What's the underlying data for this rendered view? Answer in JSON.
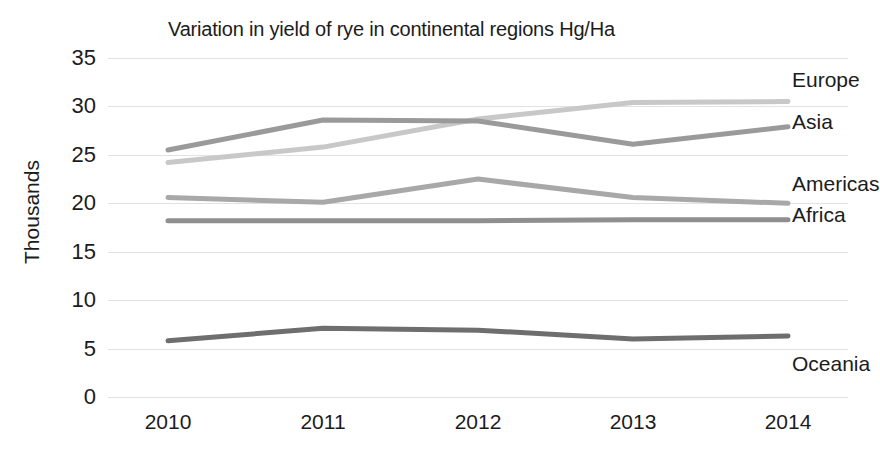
{
  "chart_data": {
    "type": "line",
    "title": "Variation in yield of rye in continental regions Hg/Ha",
    "xlabel": "",
    "ylabel": "Thousands",
    "categories": [
      "2010",
      "2011",
      "2012",
      "2013",
      "2014"
    ],
    "ylim": [
      0,
      35
    ],
    "yticks": [
      "0",
      "5",
      "10",
      "15",
      "20",
      "25",
      "30",
      "35"
    ],
    "grid": true,
    "legend_position": "right-inline-labels",
    "series": [
      {
        "name": "Europe",
        "values": [
          24.2,
          25.8,
          28.7,
          30.4,
          30.5
        ],
        "color": "#c8c8c8"
      },
      {
        "name": "Asia",
        "values": [
          25.5,
          28.6,
          28.5,
          26.1,
          27.9
        ],
        "color": "#9a9a9a"
      },
      {
        "name": "Americas",
        "values": [
          20.6,
          20.1,
          22.5,
          20.6,
          20.0
        ],
        "color": "#a8a8a8"
      },
      {
        "name": "Africa",
        "values": [
          18.2,
          18.2,
          18.2,
          18.3,
          18.3
        ],
        "color": "#8f8f8f"
      },
      {
        "name": "Oceania",
        "values": [
          5.8,
          7.1,
          6.9,
          6.0,
          6.3
        ],
        "color": "#6e6e6e"
      }
    ]
  },
  "axis": {
    "y_tick_labels": [
      "35",
      "30",
      "25",
      "20",
      "15",
      "10",
      "5",
      "0"
    ],
    "x_tick_labels": [
      "2010",
      "2011",
      "2012",
      "2013",
      "2014"
    ]
  },
  "series_labels": {
    "europe": "Europe",
    "asia": "Asia",
    "americas": "Americas",
    "africa": "Africa",
    "oceania": "Oceania"
  }
}
